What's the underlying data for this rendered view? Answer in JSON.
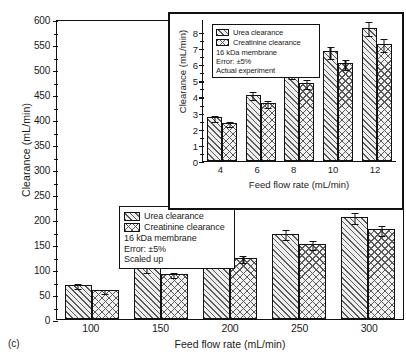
{
  "panel_tag": "(c)",
  "chart_data": [
    {
      "id": "main",
      "type": "bar",
      "title": "",
      "xlabel": "Feed flow rate (mL/min)",
      "ylabel": "Clearance (mL/min)",
      "categories": [
        "100",
        "150",
        "200",
        "250",
        "300"
      ],
      "ylim": [
        0,
        600
      ],
      "yticks": [
        0,
        50,
        100,
        150,
        200,
        250,
        300,
        350,
        400,
        450,
        500,
        550,
        600
      ],
      "grid": false,
      "legend_position": "center-left",
      "series": [
        {
          "name": "Urea clearance",
          "pattern": "diagonal-hatch",
          "values": [
            68,
            102,
            138,
            171,
            204
          ],
          "errors": [
            3.4,
            5.1,
            6.9,
            8.6,
            10.2
          ]
        },
        {
          "name": "Creatinine clearance",
          "pattern": "cross-hatch",
          "values": [
            58,
            90,
            122,
            150,
            180
          ],
          "errors": [
            2.9,
            4.5,
            6.1,
            7.5,
            9.0
          ]
        }
      ],
      "annotations": [
        "16 kDa membrane",
        "Error: ±5%",
        "Scaled up"
      ]
    },
    {
      "id": "inset",
      "type": "bar",
      "title": "",
      "xlabel": "Feed flow rate (mL/min)",
      "ylabel": "Clearance (mL/min)",
      "categories": [
        "4",
        "6",
        "8",
        "10",
        "12"
      ],
      "ylim": [
        0,
        8.8
      ],
      "yticks": [
        0,
        1,
        2,
        3,
        4,
        5,
        6,
        7,
        8
      ],
      "grid": false,
      "legend_position": "top-left",
      "series": [
        {
          "name": "Urea clearance",
          "pattern": "diagonal-hatch",
          "values": [
            2.7,
            4.1,
            5.45,
            6.8,
            8.25
          ],
          "errors": [
            0.135,
            0.21,
            0.27,
            0.34,
            0.41
          ]
        },
        {
          "name": "Creatinine clearance",
          "pattern": "cross-hatch",
          "values": [
            2.35,
            3.6,
            4.85,
            6.05,
            7.25
          ],
          "errors": [
            0.12,
            0.18,
            0.24,
            0.3,
            0.36
          ]
        }
      ],
      "annotations": [
        "16 kDa membrane",
        "Error: ±5%",
        "Actual experiment"
      ]
    }
  ],
  "colors": {
    "line": "#111111",
    "hatch": "#5a5a5a",
    "fill": "#eeeeee",
    "background": "#ffffff"
  }
}
